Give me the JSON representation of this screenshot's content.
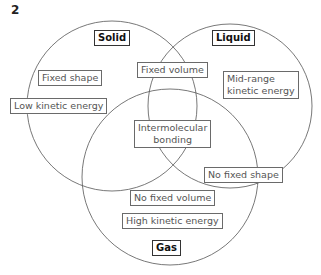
{
  "question_number": "2",
  "diagram": {
    "type": "venn",
    "sets": [
      {
        "name": "Solid",
        "label": "Solid"
      },
      {
        "name": "Liquid",
        "label": "Liquid"
      },
      {
        "name": "Gas",
        "label": "Gas"
      }
    ],
    "labels": {
      "solid_title": "Solid",
      "liquid_title": "Liquid",
      "gas_title": "Gas",
      "fixed_shape": "Fixed shape",
      "low_ke": "Low kinetic energy",
      "fixed_volume": "Fixed volume",
      "mid_ke_1": "Mid-range",
      "mid_ke_2": "kinetic energy",
      "intermol_1": "Intermolecular",
      "intermol_2": "bonding",
      "no_fixed_shape": "No fixed shape",
      "no_fixed_volume": "No fixed volume",
      "high_ke": "High kinetic energy"
    },
    "regions": [
      {
        "sets": [
          "Solid"
        ],
        "items": [
          "Fixed shape",
          "Low kinetic energy"
        ]
      },
      {
        "sets": [
          "Solid",
          "Liquid"
        ],
        "items": [
          "Fixed volume"
        ]
      },
      {
        "sets": [
          "Liquid"
        ],
        "items": [
          "Mid-range kinetic energy"
        ]
      },
      {
        "sets": [
          "Solid",
          "Liquid",
          "Gas"
        ],
        "items": [
          "Intermolecular bonding"
        ]
      },
      {
        "sets": [
          "Liquid",
          "Gas"
        ],
        "items": [
          "No fixed shape"
        ]
      },
      {
        "sets": [
          "Gas"
        ],
        "items": [
          "No fixed volume",
          "High kinetic energy"
        ]
      }
    ]
  }
}
